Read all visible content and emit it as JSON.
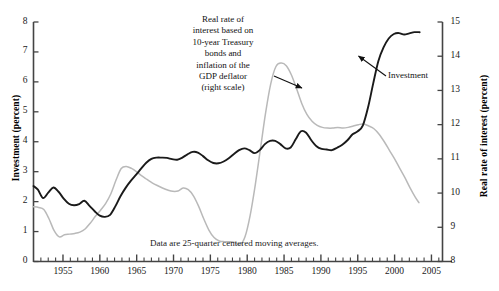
{
  "chart_data": {
    "type": "line",
    "title": "",
    "xlabel": "",
    "ylabel": "Investment  (percent)",
    "ylabel_right": "Real rate of interest (percent)",
    "xlim": [
      1951,
      2006.5
    ],
    "ylim": [
      0,
      8
    ],
    "ylim_right": [
      8,
      15
    ],
    "grid": false,
    "legend": "annotations",
    "xticks_labeled": [
      "1955",
      "1960",
      "1965",
      "1970",
      "1975",
      "1980",
      "1985",
      "1990",
      "1995",
      "2000",
      "2005"
    ],
    "xtick_values": [
      1955,
      1960,
      1965,
      1970,
      1975,
      1980,
      1985,
      1990,
      1995,
      2000,
      2005
    ],
    "xtick_minor_step": 1,
    "yticks_left": [
      "0",
      "1",
      "2",
      "3",
      "4",
      "5",
      "6",
      "7",
      "8"
    ],
    "ytick_left_values": [
      0,
      1,
      2,
      3,
      4,
      5,
      6,
      7,
      8
    ],
    "yticks_right": [
      "8",
      "9",
      "10",
      "11",
      "12",
      "13",
      "14",
      "15"
    ],
    "ytick_right_values": [
      8,
      9,
      10,
      11,
      12,
      13,
      14,
      15
    ],
    "series": [
      {
        "name": "Investment",
        "axis": "left",
        "color": "#1a1a1a",
        "width": 1.9,
        "x": [
          1951.0,
          1951.6,
          1952.3,
          1953.0,
          1953.7,
          1954.4,
          1955.1,
          1955.8,
          1956.5,
          1957.2,
          1957.9,
          1958.6,
          1959.3,
          1960.0,
          1960.7,
          1961.4,
          1962.1,
          1962.8,
          1963.5,
          1964.2,
          1964.9,
          1965.6,
          1966.3,
          1967.0,
          1967.7,
          1968.4,
          1969.1,
          1969.8,
          1970.5,
          1971.2,
          1971.9,
          1972.6,
          1973.3,
          1974.0,
          1974.7,
          1975.4,
          1976.1,
          1976.8,
          1977.5,
          1978.2,
          1978.9,
          1979.6,
          1980.3,
          1981.0,
          1981.7,
          1982.4,
          1983.1,
          1983.8,
          1984.5,
          1985.2,
          1985.9,
          1986.6,
          1987.3,
          1988.0,
          1988.7,
          1989.4,
          1990.1,
          1990.8,
          1991.5,
          1992.2,
          1992.9,
          1993.6,
          1994.3,
          1995.0,
          1995.7,
          1996.4,
          1997.1,
          1997.8,
          1998.5,
          1999.2,
          1999.9,
          2000.6,
          2001.3,
          2002.0,
          2002.7,
          2003.4
        ],
        "y": [
          2.52,
          2.4,
          2.12,
          2.3,
          2.47,
          2.33,
          2.1,
          1.93,
          1.88,
          1.92,
          2.03,
          1.86,
          1.68,
          1.53,
          1.49,
          1.56,
          1.84,
          2.18,
          2.46,
          2.69,
          2.89,
          3.1,
          3.3,
          3.43,
          3.47,
          3.47,
          3.46,
          3.42,
          3.4,
          3.47,
          3.58,
          3.66,
          3.64,
          3.52,
          3.38,
          3.29,
          3.28,
          3.34,
          3.45,
          3.59,
          3.72,
          3.78,
          3.72,
          3.62,
          3.72,
          3.92,
          4.03,
          4.03,
          3.92,
          3.78,
          3.81,
          4.09,
          4.35,
          4.3,
          4.05,
          3.85,
          3.76,
          3.74,
          3.72,
          3.8,
          3.9,
          4.05,
          4.25,
          4.35,
          4.55,
          5.15,
          5.95,
          6.7,
          7.15,
          7.45,
          7.6,
          7.63,
          7.58,
          7.62,
          7.66,
          7.66
        ]
      },
      {
        "name": "Real rate of interest based on 10-year Treasury bonds and inflation of the GDP deflator",
        "axis": "right",
        "color": "#b9b9b9",
        "width": 1.5,
        "x": [
          1951.0,
          1951.7,
          1952.4,
          1953.1,
          1953.8,
          1954.5,
          1955.2,
          1955.9,
          1956.6,
          1957.3,
          1958.0,
          1958.7,
          1959.4,
          1960.1,
          1960.8,
          1961.5,
          1962.2,
          1962.9,
          1963.6,
          1964.3,
          1965.0,
          1965.7,
          1966.4,
          1967.1,
          1967.8,
          1968.5,
          1969.2,
          1969.9,
          1970.6,
          1971.3,
          1972.0,
          1972.7,
          1973.4,
          1974.1,
          1974.8,
          1975.5,
          1976.2,
          1976.9,
          1977.6,
          1978.3,
          1979.0,
          1979.7,
          1980.4,
          1981.1,
          1981.8,
          1982.5,
          1983.2,
          1983.9,
          1984.6,
          1985.3,
          1986.0,
          1986.7,
          1987.4,
          1988.1,
          1988.8,
          1989.5,
          1990.2,
          1990.9,
          1991.6,
          1992.3,
          1993.0,
          1993.7,
          1994.4,
          1995.1,
          1995.8,
          1996.5,
          1997.2,
          1997.9,
          1998.6,
          1999.3,
          2000.0,
          2000.7,
          2001.4,
          2002.1,
          2002.8,
          2003.3
        ],
        "y": [
          9.6,
          9.58,
          9.52,
          9.25,
          8.9,
          8.72,
          8.78,
          8.8,
          8.82,
          8.86,
          8.95,
          9.12,
          9.32,
          9.5,
          9.7,
          9.98,
          10.38,
          10.72,
          10.78,
          10.72,
          10.62,
          10.5,
          10.4,
          10.3,
          10.22,
          10.15,
          10.09,
          10.05,
          10.06,
          10.15,
          10.1,
          9.92,
          9.62,
          9.25,
          8.92,
          8.7,
          8.6,
          8.58,
          8.58,
          8.56,
          8.48,
          8.72,
          9.35,
          10.25,
          11.3,
          12.35,
          13.2,
          13.7,
          13.8,
          13.72,
          13.45,
          13.05,
          12.62,
          12.3,
          12.1,
          11.98,
          11.92,
          11.9,
          11.9,
          11.92,
          11.9,
          11.92,
          11.96,
          12.0,
          12.02,
          11.96,
          11.88,
          11.72,
          11.5,
          11.25,
          11.0,
          10.72,
          10.45,
          10.15,
          9.88,
          9.72
        ]
      }
    ],
    "annotations": [
      {
        "name": "interest-callout",
        "text_lines": [
          "Real rate of",
          "interest based on",
          "10-year Treasury",
          "bonds and",
          "inflation of the",
          "GDP deflator",
          "(right scale)"
        ],
        "arrow_from": [
          274,
          76
        ],
        "arrow_to": [
          302,
          88
        ]
      },
      {
        "name": "investment-callout",
        "text_lines": [
          "Investment"
        ],
        "arrow_from": [
          386,
          76
        ],
        "arrow_to": [
          357,
          55
        ]
      }
    ],
    "footnote": "Data are 25-quarter centered moving averages."
  },
  "axes": {
    "left_title": "Investment  (percent)",
    "right_title": "Real rate of interest (percent)"
  }
}
